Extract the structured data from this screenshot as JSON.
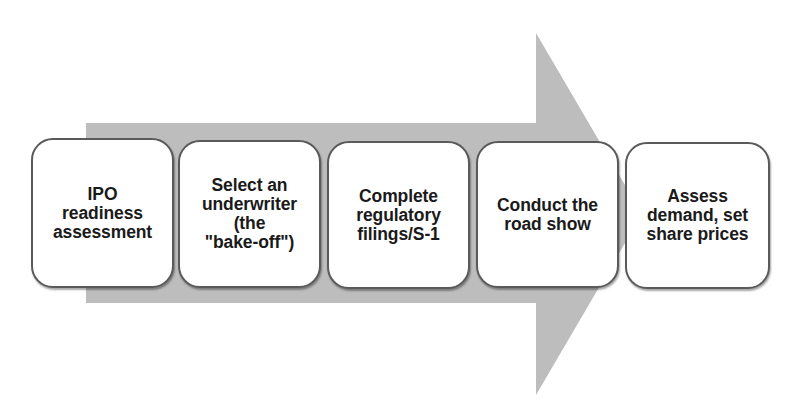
{
  "diagram": {
    "type": "process-arrow",
    "arrow_color": "#bdbdbd",
    "steps": [
      {
        "label": "IPO\nreadiness\nassessment"
      },
      {
        "label": "Select an\nunderwriter\n(the\n\"bake-off\")"
      },
      {
        "label": "Complete\nregulatory\nfilings/S-1"
      },
      {
        "label": "Conduct the\nroad show"
      },
      {
        "label": "Assess\ndemand, set\nshare prices"
      }
    ]
  }
}
